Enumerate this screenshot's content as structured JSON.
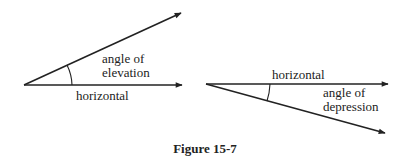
{
  "figure": {
    "caption": "Figure 15-7",
    "colors": {
      "ink": "#222222",
      "background": "#ffffff"
    }
  },
  "left_diagram": {
    "label_angle_line1": "angle of",
    "label_angle_line2": "elevation",
    "label_horizontal": "horizontal"
  },
  "right_diagram": {
    "label_horizontal": "horizontal",
    "label_angle_line1": "angle of",
    "label_angle_line2": "depression"
  }
}
